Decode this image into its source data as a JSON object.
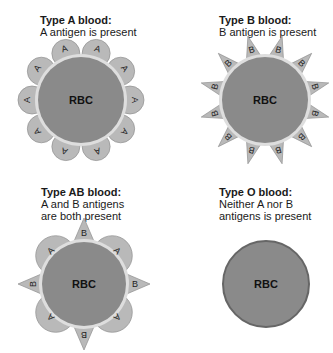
{
  "panels": [
    {
      "id": "type-a",
      "title": "Type A blood:",
      "desc_lines": [
        "A antigen is present"
      ],
      "cell_label": "RBC",
      "antigens": "A"
    },
    {
      "id": "type-b",
      "title": "Type B blood:",
      "desc_lines": [
        "B antigen is present"
      ],
      "cell_label": "RBC",
      "antigens": "B"
    },
    {
      "id": "type-ab",
      "title": "Type AB blood:",
      "desc_lines": [
        "A and B antigens",
        "are both present"
      ],
      "cell_label": "RBC",
      "antigens": "A,B"
    },
    {
      "id": "type-o",
      "title": "Type O blood:",
      "desc_lines": [
        "Neither A nor B",
        "antigens is present"
      ],
      "cell_label": "RBC",
      "antigens": "none"
    }
  ],
  "antigen_labels": {
    "a": "A",
    "b": "B"
  },
  "colors": {
    "cell_fill": "#8a8a8a",
    "cell_ring": "#dedede",
    "cell_border_o": "#666666",
    "antigen_fill": "#b9b9b9",
    "antigen_stroke": "#8f8f8f",
    "text": "#1a1a1a"
  }
}
